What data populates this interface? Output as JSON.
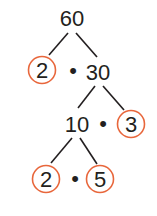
{
  "diagram": {
    "type": "factor-tree",
    "root": "60",
    "level1": {
      "left": "2",
      "right": "30",
      "separator": "•"
    },
    "level2": {
      "left": "10",
      "right": "3",
      "separator": "•"
    },
    "level3": {
      "left": "2",
      "right": "5",
      "separator": "•"
    },
    "prime_circle_color": "#E8673C",
    "line_color": "#231f20",
    "text_color": "#231f20",
    "primes_circled": [
      "2",
      "3",
      "2",
      "5"
    ]
  }
}
